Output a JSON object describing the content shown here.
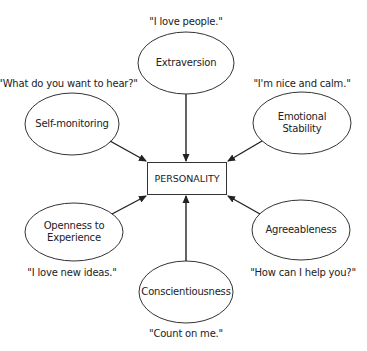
{
  "diagram": {
    "center": {
      "label": "PERSONALITY"
    },
    "traits": [
      {
        "label": "Extraversion",
        "quote": "\"I love people.\""
      },
      {
        "label": "Self-monitoring",
        "quote": "\"What do you want to hear?\""
      },
      {
        "label": "Emotional\nStability",
        "line1": "Emotional",
        "line2": "Stability",
        "quote": "\"I'm nice and calm.\""
      },
      {
        "label": "Openness to\nExperience",
        "line1": "Openness to",
        "line2": "Experience",
        "quote": "\"I love new ideas.\""
      },
      {
        "label": "Agreeableness",
        "quote": "\"How can I help you?\""
      },
      {
        "label": "Conscientiousness",
        "quote": "\"Count on me.\""
      }
    ],
    "colors": {
      "stroke": "#333333",
      "text": "#222222",
      "background": "#ffffff"
    }
  }
}
